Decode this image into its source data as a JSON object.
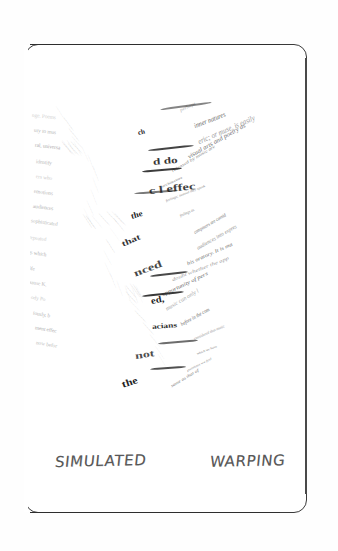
{
  "figure": {
    "kind": "scanned-document-page",
    "caption_words": [
      "SIMULATED",
      "WARPING"
    ],
    "caption_full": "SIMULATED WARPING",
    "border_color": "#2e2e2e",
    "page_background": "#ffffff",
    "ink_color": "#1d1d1d"
  },
  "warped_text": {
    "description": "Severely warped block of printed prose forming a downward wave/V shape",
    "right_fragments": [
      "perhaps",
      "inner natures",
      "eric; or muse, is easily",
      "visual arts and poetry as",
      "released by music are",
      "architecture",
      "feelings; instead they speak",
      "feelings as",
      "composers are consid",
      "audiences into expres",
      "his oratory. It is ma",
      "doubt whether the app",
      "opportunity of pers",
      "music can only l",
      "before in the com",
      "considered that music",
      "which we have",
      "passions we feel",
      "same as that of"
    ],
    "left_fragments": [
      "nge. Poems",
      "ury to mus",
      "ral, universa",
      "identify",
      "ers who",
      "emotions",
      "audiences",
      "sophisticated",
      "repeated",
      "gs which",
      "life",
      "aause K.",
      "ody Po",
      "iously, b",
      "ment effec",
      "now befor"
    ],
    "bold_crushed_fragments": [
      "ch",
      "d do",
      "c l effec",
      "the",
      "that",
      "nced",
      "ed,",
      "acians",
      "not",
      "the"
    ]
  }
}
